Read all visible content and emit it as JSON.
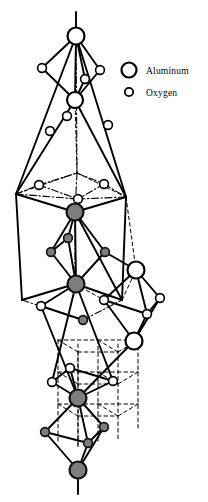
{
  "figure": {
    "background_color": "#ffffff",
    "width": 208,
    "height": 502
  },
  "legend": {
    "items": [
      {
        "label": "Aluminum",
        "marker": "large-open-circle",
        "radius": 7.5,
        "fill": "#ffffff",
        "stroke": "#000000",
        "stroke_width": 2.2,
        "cx": 129,
        "cy": 70
      },
      {
        "label": "Oxygen",
        "marker": "small-open-circle",
        "radius": 4.2,
        "fill": "#ffffff",
        "stroke": "#000000",
        "stroke_width": 1.8,
        "cx": 129,
        "cy": 92
      }
    ],
    "label_x": 146,
    "text_color": "#000000"
  },
  "colors": {
    "line": "#000000",
    "open_fill": "#ffffff",
    "shaded_fill": "#7d7d7d",
    "shaded_stroke": "#111111"
  },
  "atoms": {
    "aluminum": [
      {
        "id": "al-top-apex",
        "cx": 76,
        "cy": 36,
        "r": 8.5,
        "style": "open"
      },
      {
        "id": "al-upper-inner",
        "cx": 75,
        "cy": 100,
        "r": 8.0,
        "style": "open"
      },
      {
        "id": "al-mid-upper",
        "cx": 75,
        "cy": 212,
        "r": 8.5,
        "style": "shaded"
      },
      {
        "id": "al-mid-lower",
        "cx": 76,
        "cy": 284,
        "r": 8.5,
        "style": "shaded"
      },
      {
        "id": "al-right-upper",
        "cx": 136,
        "cy": 270,
        "r": 8.5,
        "style": "open"
      },
      {
        "id": "al-right-lower",
        "cx": 134,
        "cy": 341,
        "r": 8.5,
        "style": "open"
      },
      {
        "id": "al-lower-inner",
        "cx": 78,
        "cy": 398,
        "r": 8.5,
        "style": "shaded"
      },
      {
        "id": "al-bottom-apex",
        "cx": 78,
        "cy": 470,
        "r": 8.5,
        "style": "shaded"
      }
    ],
    "oxygen": [
      {
        "id": "o-top-left",
        "cx": 42,
        "cy": 68,
        "r": 4.4,
        "style": "open"
      },
      {
        "id": "o-top-right",
        "cx": 100,
        "cy": 70,
        "r": 4.4,
        "style": "open"
      },
      {
        "id": "o-top-inner",
        "cx": 85,
        "cy": 79,
        "r": 4.4,
        "style": "open"
      },
      {
        "id": "o-upper-a",
        "cx": 67,
        "cy": 116,
        "r": 4.4,
        "style": "open"
      },
      {
        "id": "o-upper-b",
        "cx": 50,
        "cy": 131,
        "r": 4.4,
        "style": "open"
      },
      {
        "id": "o-upper-c",
        "cx": 108,
        "cy": 125,
        "r": 4.4,
        "style": "open"
      },
      {
        "id": "o-rhomb-left",
        "cx": 39,
        "cy": 185,
        "r": 4.4,
        "style": "open"
      },
      {
        "id": "o-rhomb-right",
        "cx": 104,
        "cy": 184,
        "r": 4.4,
        "style": "open"
      },
      {
        "id": "o-rhomb-front",
        "cx": 78,
        "cy": 199,
        "r": 4.4,
        "style": "open"
      },
      {
        "id": "o-mid-top",
        "cx": 68,
        "cy": 238,
        "r": 4.4,
        "style": "shaded"
      },
      {
        "id": "o-mid-left",
        "cx": 51,
        "cy": 252,
        "r": 4.4,
        "style": "shaded"
      },
      {
        "id": "o-mid-right",
        "cx": 105,
        "cy": 252,
        "r": 4.4,
        "style": "shaded"
      },
      {
        "id": "o-right-left",
        "cx": 104,
        "cy": 300,
        "r": 4.4,
        "style": "open"
      },
      {
        "id": "o-right-right",
        "cx": 160,
        "cy": 298,
        "r": 4.4,
        "style": "open"
      },
      {
        "id": "o-right-front",
        "cx": 147,
        "cy": 314,
        "r": 4.4,
        "style": "open"
      },
      {
        "id": "o-left-low",
        "cx": 41,
        "cy": 306,
        "r": 4.4,
        "style": "open"
      },
      {
        "id": "o-center-low",
        "cx": 83,
        "cy": 320,
        "r": 4.4,
        "style": "shaded"
      },
      {
        "id": "o-lower-top",
        "cx": 70,
        "cy": 368,
        "r": 4.4,
        "style": "open"
      },
      {
        "id": "o-lower-left",
        "cx": 52,
        "cy": 382,
        "r": 4.4,
        "style": "open"
      },
      {
        "id": "o-lower-right",
        "cx": 113,
        "cy": 381,
        "r": 4.4,
        "style": "open"
      },
      {
        "id": "o-bot-left",
        "cx": 45,
        "cy": 432,
        "r": 4.4,
        "style": "shaded"
      },
      {
        "id": "o-bot-right",
        "cx": 104,
        "cy": 427,
        "r": 4.4,
        "style": "shaded"
      },
      {
        "id": "o-bot-front",
        "cx": 88,
        "cy": 443,
        "r": 4.4,
        "style": "shaded"
      }
    ]
  },
  "bonds": {
    "solid": [
      [
        76,
        12,
        76,
        36
      ],
      [
        76,
        36,
        42,
        68
      ],
      [
        76,
        36,
        100,
        70
      ],
      [
        76,
        36,
        85,
        79
      ],
      [
        76,
        36,
        75,
        100
      ],
      [
        42,
        68,
        75,
        100
      ],
      [
        100,
        70,
        75,
        100
      ],
      [
        85,
        79,
        75,
        100
      ],
      [
        76,
        36,
        16,
        194
      ],
      [
        76,
        36,
        126,
        197
      ],
      [
        16,
        194,
        75,
        100
      ],
      [
        126,
        197,
        75,
        100
      ],
      [
        16,
        194,
        75,
        212
      ],
      [
        126,
        197,
        75,
        212
      ],
      [
        16,
        194,
        22,
        300
      ],
      [
        126,
        197,
        122,
        300
      ],
      [
        22,
        300,
        75,
        284
      ],
      [
        122,
        300,
        76,
        284
      ],
      [
        75,
        212,
        68,
        238
      ],
      [
        75,
        212,
        51,
        252
      ],
      [
        75,
        212,
        105,
        252
      ],
      [
        75,
        212,
        76,
        284
      ],
      [
        68,
        238,
        51,
        252
      ],
      [
        68,
        238,
        76,
        284
      ],
      [
        51,
        252,
        76,
        284
      ],
      [
        105,
        252,
        76,
        284
      ],
      [
        75,
        212,
        122,
        300
      ],
      [
        105,
        252,
        136,
        270
      ],
      [
        136,
        270,
        104,
        300
      ],
      [
        136,
        270,
        160,
        298
      ],
      [
        136,
        270,
        147,
        314
      ],
      [
        104,
        300,
        147,
        314
      ],
      [
        160,
        298,
        147,
        314
      ],
      [
        104,
        300,
        134,
        341
      ],
      [
        147,
        314,
        134,
        341
      ],
      [
        160,
        298,
        134,
        341
      ],
      [
        76,
        284,
        41,
        306
      ],
      [
        41,
        306,
        83,
        320
      ],
      [
        76,
        284,
        113,
        381
      ],
      [
        76,
        284,
        52,
        382
      ],
      [
        134,
        341,
        78,
        398
      ],
      [
        41,
        306,
        78,
        398
      ],
      [
        70,
        368,
        78,
        398
      ],
      [
        52,
        382,
        78,
        398
      ],
      [
        113,
        381,
        78,
        398
      ],
      [
        52,
        382,
        70,
        368
      ],
      [
        113,
        381,
        70,
        368
      ],
      [
        78,
        398,
        45,
        432
      ],
      [
        78,
        398,
        104,
        427
      ],
      [
        78,
        398,
        88,
        443
      ],
      [
        45,
        432,
        78,
        470
      ],
      [
        104,
        427,
        78,
        470
      ],
      [
        88,
        443,
        78,
        470
      ],
      [
        45,
        432,
        88,
        443
      ],
      [
        104,
        427,
        88,
        443
      ],
      [
        78,
        470,
        78,
        494
      ]
    ],
    "dash_dot": [
      [
        16,
        194,
        39,
        185
      ],
      [
        39,
        185,
        77,
        173
      ],
      [
        77,
        173,
        104,
        184
      ],
      [
        104,
        184,
        126,
        197
      ],
      [
        16,
        194,
        78,
        199
      ],
      [
        78,
        199,
        126,
        197
      ],
      [
        39,
        185,
        78,
        199
      ],
      [
        104,
        184,
        78,
        199
      ],
      [
        76,
        36,
        77,
        173
      ],
      [
        77,
        173,
        75,
        212
      ],
      [
        75,
        212,
        75,
        284
      ],
      [
        78,
        199,
        75,
        212
      ],
      [
        22,
        300,
        83,
        320
      ],
      [
        83,
        320,
        122,
        300
      ],
      [
        41,
        306,
        83,
        320
      ]
    ],
    "dashed": [
      [
        77,
        173,
        75,
        100
      ],
      [
        77,
        173,
        126,
        197
      ],
      [
        77,
        173,
        16,
        194
      ],
      [
        126,
        197,
        136,
        270
      ],
      [
        122,
        300,
        136,
        270
      ],
      [
        75,
        284,
        104,
        300
      ],
      [
        58,
        340,
        58,
        444
      ],
      [
        98,
        340,
        98,
        444
      ],
      [
        138,
        340,
        138,
        430
      ],
      [
        78,
        344,
        78,
        448
      ],
      [
        118,
        344,
        118,
        440
      ],
      [
        58,
        340,
        98,
        340
      ],
      [
        98,
        340,
        138,
        340
      ],
      [
        58,
        372,
        98,
        372
      ],
      [
        98,
        372,
        138,
        372
      ],
      [
        58,
        404,
        98,
        404
      ],
      [
        98,
        404,
        138,
        404
      ],
      [
        58,
        340,
        78,
        352
      ],
      [
        98,
        340,
        118,
        352
      ],
      [
        78,
        352,
        78,
        448
      ],
      [
        58,
        372,
        78,
        384
      ],
      [
        98,
        372,
        118,
        384
      ],
      [
        58,
        404,
        78,
        416
      ],
      [
        98,
        404,
        118,
        416
      ],
      [
        78,
        352,
        118,
        352
      ],
      [
        78,
        384,
        118,
        384
      ],
      [
        78,
        416,
        118,
        416
      ],
      [
        138,
        340,
        118,
        352
      ],
      [
        138,
        372,
        118,
        384
      ],
      [
        138,
        404,
        118,
        416
      ]
    ]
  }
}
